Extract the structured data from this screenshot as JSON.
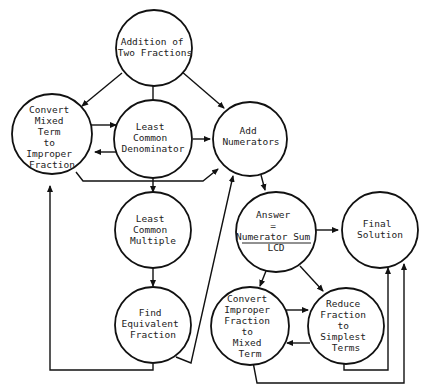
{
  "diagram": {
    "type": "flowchart",
    "title": "Addition of Two Fractions",
    "colors": {
      "line": "#111111",
      "text": "#222222",
      "background": "#ffffff"
    },
    "nodes": {
      "addition": {
        "lines": [
          "Addition of",
          "Two Fractions"
        ]
      },
      "convert_mixed": {
        "lines": [
          "Convert",
          "Mixed",
          "Term",
          "to",
          "Improper",
          "Fraction"
        ]
      },
      "lcd": {
        "lines": [
          "Least",
          "Common",
          "Denominator"
        ]
      },
      "add_numerators": {
        "lines": [
          "Add",
          "Numerators"
        ]
      },
      "lcm": {
        "lines": [
          "Least",
          "Common",
          "Multiple"
        ]
      },
      "equivalent": {
        "lines": [
          "Find",
          "Equivalent",
          "Fraction"
        ]
      },
      "answer": {
        "lines": [
          "Answer",
          "=",
          "Numerator Sum",
          "LCD"
        ]
      },
      "final": {
        "lines": [
          "Final",
          "Solution"
        ]
      },
      "convert_improper": {
        "lines": [
          "Convert",
          "Improper",
          "Fraction",
          "to",
          "Mixed",
          "Term"
        ]
      },
      "reduce": {
        "lines": [
          "Reduce",
          "Fraction",
          "to",
          "Simplest",
          "Terms"
        ]
      }
    },
    "edges": [
      {
        "from": "Addition of Two Fractions",
        "to": "Convert Mixed Term to Improper Fraction"
      },
      {
        "from": "Addition of Two Fractions",
        "to": "Least Common Denominator"
      },
      {
        "from": "Addition of Two Fractions",
        "to": "Add Numerators"
      },
      {
        "from": "Convert Mixed Term to Improper Fraction",
        "to": "Least Common Denominator"
      },
      {
        "from": "Least Common Denominator",
        "to": "Convert Mixed Term to Improper Fraction"
      },
      {
        "from": "Least Common Denominator",
        "to": "Add Numerators"
      },
      {
        "from": "Convert Mixed Term to Improper Fraction",
        "to": "Add Numerators"
      },
      {
        "from": "Least Common Denominator",
        "to": "Least Common Multiple"
      },
      {
        "from": "Least Common Multiple",
        "to": "Find Equivalent Fraction"
      },
      {
        "from": "Find Equivalent Fraction",
        "to": "Add Numerators"
      },
      {
        "from": "Find Equivalent Fraction",
        "to": "Convert Mixed Term to Improper Fraction"
      },
      {
        "from": "Add Numerators",
        "to": "Answer = Numerator Sum / LCD"
      },
      {
        "from": "Answer = Numerator Sum / LCD",
        "to": "Final Solution"
      },
      {
        "from": "Answer = Numerator Sum / LCD",
        "to": "Convert Improper Fraction to Mixed Term"
      },
      {
        "from": "Answer = Numerator Sum / LCD",
        "to": "Reduce Fraction to Simplest Terms"
      },
      {
        "from": "Convert Improper Fraction to Mixed Term",
        "to": "Reduce Fraction to Simplest Terms"
      },
      {
        "from": "Reduce Fraction to Simplest Terms",
        "to": "Convert Improper Fraction to Mixed Term"
      },
      {
        "from": "Reduce Fraction to Simplest Terms",
        "to": "Final Solution"
      },
      {
        "from": "Convert Improper Fraction to Mixed Term",
        "to": "Final Solution"
      }
    ]
  }
}
